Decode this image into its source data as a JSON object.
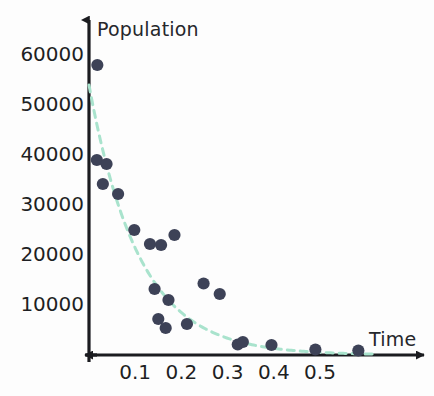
{
  "chart_data": {
    "type": "scatter",
    "title": "",
    "xlabel": "Time",
    "ylabel": "Population",
    "xlim": [
      0,
      0.62
    ],
    "ylim": [
      0,
      63000
    ],
    "grid": false,
    "legend": false,
    "x_ticks": [
      0.1,
      0.2,
      0.3,
      0.4,
      0.5
    ],
    "x_tick_labels": [
      "0.1",
      "0.2",
      "0.3",
      "0.4",
      "0.5"
    ],
    "y_ticks": [
      10000,
      20000,
      30000,
      40000,
      50000,
      60000
    ],
    "y_tick_labels": [
      "10000",
      "20000",
      "30000",
      "40000",
      "50000",
      "60000"
    ],
    "series": [
      {
        "name": "observations",
        "type": "scatter",
        "marker": "circle",
        "color": "#3d4257",
        "points": [
          [
            0.018,
            58000
          ],
          [
            0.017,
            39000
          ],
          [
            0.038,
            38200
          ],
          [
            0.03,
            34200
          ],
          [
            0.063,
            32200
          ],
          [
            0.098,
            25000
          ],
          [
            0.132,
            22200
          ],
          [
            0.156,
            22000
          ],
          [
            0.185,
            24000
          ],
          [
            0.142,
            13200
          ],
          [
            0.172,
            11000
          ],
          [
            0.15,
            7200
          ],
          [
            0.166,
            5400
          ],
          [
            0.212,
            6200
          ],
          [
            0.248,
            14300
          ],
          [
            0.283,
            12200
          ],
          [
            0.322,
            2100
          ],
          [
            0.333,
            2600
          ],
          [
            0.395,
            2000
          ],
          [
            0.49,
            1100
          ],
          [
            0.583,
            900
          ]
        ]
      },
      {
        "name": "exponential-fit",
        "type": "line",
        "style": "dashed",
        "color": "#a9e3cd",
        "model": "y = 54000 * exp(-x / 0.108)",
        "amplitude": 54000,
        "decay_constant": 0.108,
        "x_range": [
          0.0,
          0.62
        ]
      }
    ],
    "colors": {
      "marker": "#3d4257",
      "fit_line": "#a9e3cd",
      "axis": "#1b1c20",
      "text": "#1e1f23",
      "background": "#fdfdfd"
    },
    "axis_geometry": {
      "x_origin_px": 89,
      "y_zero_px": 355,
      "px_per_x_unit": 462,
      "px_per_y_unit": 0.005
    }
  }
}
